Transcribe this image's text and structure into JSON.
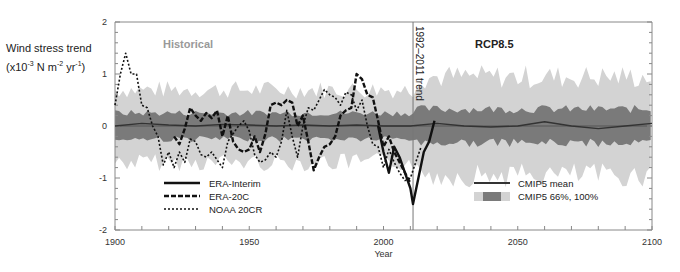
{
  "chart_data": {
    "type": "line",
    "title": "",
    "xlabel": "Year",
    "ylabel_line1": "Wind stress trend",
    "ylabel_line2_parts": [
      "(x10",
      "-3",
      " N m",
      "-2",
      " yr",
      "-1",
      ")"
    ],
    "xlim": [
      1900,
      2100
    ],
    "ylim": [
      -2,
      2
    ],
    "xticks": [
      1900,
      1950,
      2000,
      2050,
      2100
    ],
    "yticks": [
      -2,
      -1,
      0,
      1,
      2
    ],
    "annotations": {
      "historical": "Historical",
      "rcp": "RCP8.5",
      "vline_label": "1992–2011 trend",
      "vline_year": 2011
    },
    "legend_left": [
      {
        "name": "ERA-Interim",
        "style": "solid"
      },
      {
        "name": "ERA-20C",
        "style": "dashed"
      },
      {
        "name": "NOAA 20CR",
        "style": "dotted"
      }
    ],
    "legend_right": [
      {
        "name": "CMIP5 mean",
        "style": "solid"
      },
      {
        "name": "CMIP5 66%, 100%",
        "style": "band"
      }
    ],
    "series": [
      {
        "name": "ERA-Interim",
        "x": [
          1998,
          2000,
          2002,
          2004,
          2006,
          2008,
          2010,
          2011,
          2013,
          2015,
          2017,
          2019
        ],
        "values": [
          0.0,
          -0.5,
          -0.9,
          -0.4,
          -0.6,
          -0.9,
          -1.2,
          -1.5,
          -1.0,
          -0.5,
          -0.3,
          0.1
        ]
      },
      {
        "name": "ERA-20C",
        "x": [
          1922,
          1924,
          1926,
          1928,
          1930,
          1932,
          1934,
          1936,
          1938,
          1940,
          1942,
          1944,
          1946,
          1948,
          1950,
          1952,
          1954,
          1956,
          1958,
          1960,
          1962,
          1964,
          1966,
          1968,
          1970,
          1972,
          1974,
          1976,
          1978,
          1980,
          1982,
          1984,
          1986,
          1988,
          1990,
          1992,
          1994,
          1996,
          1998,
          2000,
          2002,
          2004,
          2006,
          2008,
          2010
        ],
        "values": [
          -0.2,
          -0.35,
          -0.05,
          0.35,
          0.2,
          0.1,
          0.25,
          0.15,
          0.3,
          -0.2,
          0.2,
          -0.3,
          -0.45,
          -0.5,
          -0.45,
          -0.2,
          -0.5,
          -0.15,
          0.4,
          0.45,
          0.4,
          0.5,
          0.45,
          0.0,
          0.2,
          -0.3,
          -0.85,
          -0.6,
          -0.4,
          -0.35,
          -0.2,
          0.2,
          0.3,
          0.35,
          1.0,
          0.9,
          0.6,
          0.55,
          0.1,
          -0.4,
          -0.2,
          -0.5,
          -0.7,
          -0.9,
          -1.1
        ]
      },
      {
        "name": "NOAA 20CR",
        "x": [
          1900,
          1902,
          1904,
          1906,
          1908,
          1910,
          1912,
          1914,
          1916,
          1918,
          1920,
          1922,
          1924,
          1926,
          1928,
          1930,
          1932,
          1934,
          1936,
          1938,
          1940,
          1942,
          1944,
          1946,
          1948,
          1950,
          1952,
          1954,
          1956,
          1958,
          1960,
          1962,
          1964,
          1966,
          1968,
          1970,
          1972,
          1974,
          1976,
          1978,
          1980,
          1982,
          1984,
          1986,
          1988,
          1990,
          1992,
          1994,
          1996,
          1998,
          2000,
          2002,
          2004,
          2006,
          2008,
          2010,
          2012,
          2014
        ],
        "values": [
          0.4,
          1.0,
          1.4,
          1.0,
          1.0,
          0.4,
          0.35,
          0.0,
          -0.2,
          -0.75,
          -0.5,
          -0.8,
          -0.5,
          -0.7,
          -0.25,
          -0.3,
          -0.55,
          -0.6,
          -0.5,
          -0.65,
          -0.8,
          -0.3,
          -0.15,
          0.0,
          0.1,
          -0.1,
          -0.55,
          -0.7,
          -0.65,
          -0.5,
          -0.6,
          -0.3,
          0.3,
          -0.2,
          -0.6,
          0.0,
          0.35,
          0.3,
          0.5,
          0.7,
          0.6,
          0.55,
          0.4,
          0.65,
          0.6,
          0.3,
          0.5,
          0.0,
          -0.35,
          -0.4,
          -0.8,
          -0.45,
          -0.7,
          -0.9,
          -1.05,
          -1.0,
          -0.7,
          -0.4
        ]
      },
      {
        "name": "CMIP5 mean",
        "x": [
          1900,
          1910,
          1920,
          1930,
          1940,
          1950,
          1960,
          1970,
          1980,
          1990,
          2000,
          2010,
          2020,
          2030,
          2040,
          2050,
          2060,
          2070,
          2080,
          2090,
          2100
        ],
        "values": [
          0.0,
          0.05,
          0.02,
          0.0,
          0.03,
          0.02,
          0.0,
          0.02,
          0.0,
          0.02,
          0.0,
          0.0,
          0.05,
          0.0,
          -0.02,
          0.0,
          0.08,
          0.0,
          -0.05,
          0.0,
          0.05
        ]
      }
    ],
    "bands": {
      "cmip5_66": {
        "upper": 0.25,
        "lower": -0.25,
        "color": "#7a7a7a"
      },
      "cmip5_100": {
        "upper": 0.7,
        "lower": -0.7,
        "color": "#d3d3d3"
      }
    }
  }
}
